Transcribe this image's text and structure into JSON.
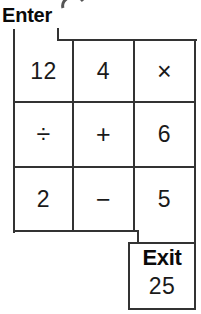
{
  "diagram": {
    "title_label": "Enter",
    "grid": {
      "rows": [
        {
          "cells": [
            {
              "value": "12",
              "kind": "number"
            },
            {
              "value": "4",
              "kind": "number"
            },
            {
              "value": "×",
              "kind": "operator"
            }
          ]
        },
        {
          "cells": [
            {
              "value": "÷",
              "kind": "operator"
            },
            {
              "value": "+",
              "kind": "operator"
            },
            {
              "value": "6",
              "kind": "number"
            }
          ]
        },
        {
          "cells": [
            {
              "value": "2",
              "kind": "number"
            },
            {
              "value": "−",
              "kind": "operator"
            },
            {
              "value": "5",
              "kind": "number"
            }
          ]
        }
      ]
    },
    "exit": {
      "label": "Exit",
      "value": "25"
    },
    "colors": {
      "line": "#333333",
      "text": "#1a1a1a",
      "bold_text": "#0a0a0a",
      "background": "#ffffff"
    }
  }
}
